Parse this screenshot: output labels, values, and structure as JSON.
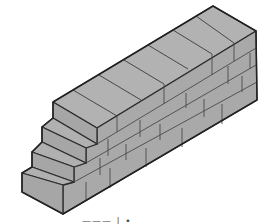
{
  "figure": {
    "caption_partial": "——— ∣ •",
    "colors": {
      "face_fill": "#a9a9a9",
      "top_fill": "#b2b2b2",
      "outline": "#2e2e2e",
      "mortar": "#4a4a4a",
      "background": "#ffffff"
    },
    "steps": 4,
    "courses": 4
  }
}
